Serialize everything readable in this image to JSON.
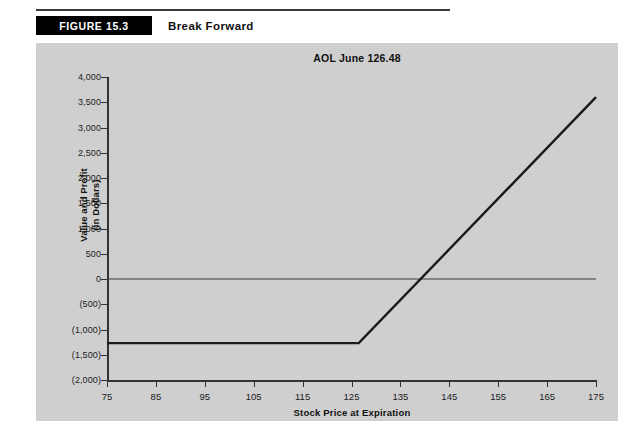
{
  "header": {
    "figure_tag": "FIGURE 15.3",
    "figure_title": "Break Forward"
  },
  "chart_data": {
    "type": "line",
    "title": "AOL June 126.48",
    "xlabel": "Stock Price at Expiration",
    "ylabel": "Value and Profit (in Dollars)",
    "ylabel_line1": "Value and Profit",
    "ylabel_line2": "(in Dollars)",
    "xlim": [
      75,
      175
    ],
    "ylim": [
      -2000,
      4000
    ],
    "xticks": [
      75,
      85,
      95,
      105,
      115,
      125,
      135,
      145,
      155,
      165,
      175
    ],
    "xticklabels": [
      "75",
      "85",
      "95",
      "105",
      "115",
      "125",
      "135",
      "145",
      "155",
      "165",
      "175"
    ],
    "yticks": [
      -2000,
      -1500,
      -1000,
      -500,
      0,
      500,
      1000,
      1500,
      2000,
      2500,
      3000,
      3500,
      4000
    ],
    "yticklabels": [
      "(2,000)",
      "(1,500)",
      "(1,000)",
      "(500)",
      "0",
      "500",
      "1,000",
      "1,500",
      "2,000",
      "2,500",
      "3,000",
      "3,500",
      "4,000"
    ],
    "grid": false,
    "legend": null,
    "strike": 126.48,
    "zero_line": 0,
    "series": [
      {
        "name": "Break forward payoff",
        "color": "#1a1a1a",
        "x": [
          75,
          126.48,
          175
        ],
        "values": [
          -1270,
          -1270,
          3600
        ]
      }
    ],
    "annotations": {
      "breakeven_x": 139,
      "floor_value": -1270,
      "max_shown_value": 3600
    }
  }
}
